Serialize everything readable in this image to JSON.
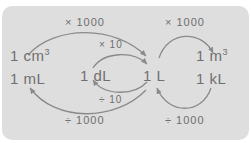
{
  "figure": {
    "panel_color": "#dedede",
    "background_color": "#ffffff",
    "ink_color": "#707070"
  },
  "nodes": [
    {
      "id": "cm3",
      "base": "1 cm",
      "sup": "3",
      "name": "node-1-cm3"
    },
    {
      "id": "ml",
      "base": "1 mL",
      "sup": "",
      "name": "node-1-ml"
    },
    {
      "id": "dl",
      "base": "1 dL",
      "sup": "",
      "name": "node-1-dl"
    },
    {
      "id": "l",
      "base": "1 L",
      "sup": "",
      "name": "node-1-l"
    },
    {
      "id": "m3",
      "base": "1 m",
      "sup": "3",
      "name": "node-1-m3"
    },
    {
      "id": "kl",
      "base": "1 kL",
      "sup": "",
      "name": "node-1-kl"
    }
  ],
  "operations": {
    "multiply_1000_left": "× 1000",
    "multiply_1000_right": "× 1000",
    "multiply_10": "× 10",
    "divide_10": "÷ 10",
    "divide_1000_left": "÷ 1000",
    "divide_1000_right": "÷ 1000"
  },
  "arrows": [
    {
      "name": "arrow-cm3-to-l",
      "from": "1 cm3 / 1 mL",
      "to": "1 L",
      "label": "× 1000",
      "direction": "right"
    },
    {
      "name": "arrow-l-to-ml",
      "from": "1 L",
      "to": "1 mL",
      "label": "÷ 1000",
      "direction": "left"
    },
    {
      "name": "arrow-dl-to-l",
      "from": "1 dL",
      "to": "1 L",
      "label": "× 10",
      "direction": "right"
    },
    {
      "name": "arrow-l-to-dl",
      "from": "1 L",
      "to": "1 dL",
      "label": "÷ 10",
      "direction": "left"
    },
    {
      "name": "arrow-l-to-m3",
      "from": "1 L",
      "to": "1 m3",
      "label": "× 1000",
      "direction": "right"
    },
    {
      "name": "arrow-kl-to-l",
      "from": "1 kL",
      "to": "1 L",
      "label": "÷ 1000",
      "direction": "left"
    }
  ]
}
